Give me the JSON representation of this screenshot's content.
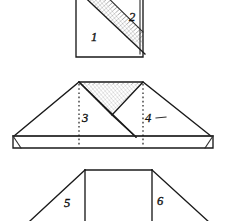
{
  "diagram": {
    "background_color": "#ffffff",
    "ink_color": "#1a1a1a",
    "shade_color": "#9a9a9a",
    "steps": [
      {
        "id": "step-1",
        "name": "square-with-diagonal",
        "labels": [
          {
            "id": "label-1",
            "text": "1",
            "x": 93,
            "y": 40
          },
          {
            "id": "label-2",
            "text": "2",
            "x": 131,
            "y": 20
          }
        ]
      },
      {
        "id": "step-2",
        "name": "peaked-trapezoid",
        "labels": [
          {
            "id": "label-3",
            "text": "3",
            "x": 83,
            "y": 120
          },
          {
            "id": "label-4",
            "text": "4",
            "x": 147,
            "y": 120
          }
        ]
      },
      {
        "id": "step-3",
        "name": "wide-trapezoid-with-rectangle",
        "labels": [
          {
            "id": "label-5",
            "text": "5",
            "x": 67,
            "y": 205
          },
          {
            "id": "label-6",
            "text": "6",
            "x": 160,
            "y": 203
          }
        ]
      }
    ]
  }
}
